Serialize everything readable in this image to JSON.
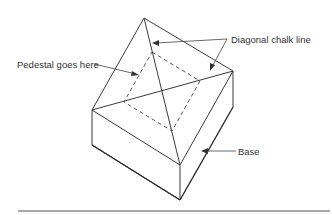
{
  "figure": {
    "labels": {
      "pedestal": "Pedestal goes here",
      "diagonal": "Diagonal chalk line",
      "base": "Base"
    },
    "colors": {
      "line": "#3a3a3a",
      "text": "#333333",
      "background": "#ffffff"
    }
  }
}
